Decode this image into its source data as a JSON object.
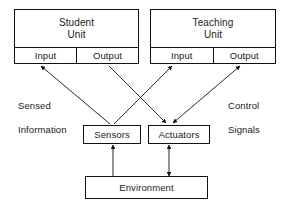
{
  "diagram": {
    "stroke_color": "#111111",
    "text_color": "#1a1a1a",
    "background_color": "#ffffff"
  },
  "nodes": {
    "student_unit": {
      "title_line1": "Student",
      "title_line2": "Unit",
      "input_label": "Input",
      "output_label": "Output"
    },
    "teaching_unit": {
      "title_line1": "Teaching",
      "title_line2": "Unit",
      "input_label": "Input",
      "output_label": "Output"
    },
    "sensors": {
      "label": "Sensors"
    },
    "actuators": {
      "label": "Actuators"
    },
    "environment": {
      "label": "Environment"
    }
  },
  "labels": {
    "sensed_information": {
      "line1": "Sensed",
      "line2": "Information"
    },
    "control_signals": {
      "line1": "Control",
      "line2": "Signals"
    }
  },
  "edges": [
    {
      "name": "sensors-to-student-input",
      "from": "sensors",
      "to": "student_unit.input",
      "arrows": "end"
    },
    {
      "name": "sensors-to-teaching-input",
      "from": "sensors",
      "to": "teaching_unit.input",
      "arrows": "end"
    },
    {
      "name": "student-output-to-actuators",
      "from": "student_unit.output",
      "to": "actuators",
      "arrows": "end"
    },
    {
      "name": "teaching-output-to-actuators",
      "from": "teaching_unit.output",
      "to": "actuators",
      "arrows": "both"
    },
    {
      "name": "environment-to-sensors",
      "from": "environment",
      "to": "sensors",
      "arrows": "end"
    },
    {
      "name": "actuators-to-environment",
      "from": "actuators",
      "to": "environment",
      "arrows": "both"
    }
  ]
}
